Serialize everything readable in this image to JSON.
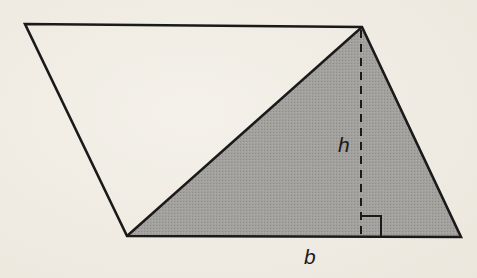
{
  "figure": {
    "type": "parallelogram-with-shaded-triangle",
    "colors": {
      "background": "#f1eee6",
      "stroke": "#1a1a1a",
      "shade": "#9d9b97"
    },
    "parallelogram": {
      "vertices": [
        [
          25,
          24
        ],
        [
          362,
          27
        ],
        [
          461,
          237
        ],
        [
          127,
          236
        ]
      ]
    },
    "shaded_triangle": {
      "vertices": [
        [
          127,
          236
        ],
        [
          362,
          27
        ],
        [
          461,
          237
        ]
      ]
    },
    "height_line": {
      "style": "dashed",
      "from": [
        361,
        29
      ],
      "to": [
        361,
        236
      ]
    },
    "right_angle_marker": {
      "x": 361,
      "y": 215,
      "size": 20
    },
    "labels": {
      "height": "h",
      "base": "b"
    }
  }
}
